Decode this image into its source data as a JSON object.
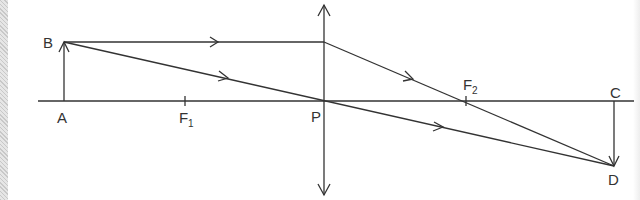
{
  "diagram": {
    "type": "convex lens ray diagram",
    "stroke_color": "#333333",
    "labels": {
      "object_top": "B",
      "object_base": "A",
      "focus1": "F",
      "focus1_sub": "1",
      "lens_center": "P",
      "focus2": "F",
      "focus2_sub": "2",
      "image_base": "C",
      "image_tip": "D"
    },
    "points": {
      "A": [
        64,
        101
      ],
      "B": [
        64,
        42
      ],
      "F1": [
        185,
        101
      ],
      "P": [
        324,
        101
      ],
      "F2": [
        466,
        101
      ],
      "C": [
        614,
        101
      ],
      "D": [
        614,
        166
      ],
      "lens_top": [
        324,
        5
      ],
      "lens_bottom": [
        324,
        195
      ],
      "refraction_point": [
        324,
        42
      ]
    }
  }
}
